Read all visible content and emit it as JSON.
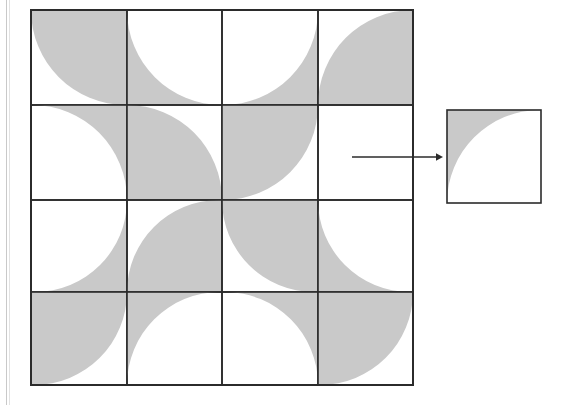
{
  "figure": {
    "title": "Quarter-disc tiling pattern with extracted unit tile",
    "background_color": "#ffffff",
    "fill_color": "#c9c9c9",
    "stroke_color": "#2b2b2b",
    "page_rule_color": "#c9c9c9"
  },
  "grid": {
    "name": "tiling-grid",
    "rows": 4,
    "cols": 4,
    "x": 31,
    "y": 10,
    "col_edges": [
      31,
      127,
      222,
      318,
      413
    ],
    "row_edges": [
      10,
      105,
      200,
      292,
      385
    ],
    "border_width": 1.6,
    "tiles": [
      {
        "row": 1,
        "col": 1,
        "corner": "bottom-left",
        "inverted": true,
        "label": "tile-r1c1"
      },
      {
        "row": 1,
        "col": 2,
        "corner": "bottom-left",
        "inverted": false,
        "label": "tile-r1c2"
      },
      {
        "row": 1,
        "col": 3,
        "corner": "bottom-right",
        "inverted": false,
        "label": "tile-r1c3"
      },
      {
        "row": 1,
        "col": 4,
        "corner": "top-left",
        "inverted": true,
        "label": "tile-r1c4"
      },
      {
        "row": 2,
        "col": 1,
        "corner": "top-right",
        "inverted": false,
        "label": "tile-r2c1"
      },
      {
        "row": 2,
        "col": 2,
        "corner": "top-right",
        "inverted": true,
        "label": "tile-r2c2"
      },
      {
        "row": 2,
        "col": 3,
        "corner": "bottom-right",
        "inverted": true,
        "label": "tile-r2c3"
      },
      {
        "row": 2,
        "col": 4,
        "corner": "none",
        "inverted": false,
        "label": "tile-r2c4"
      },
      {
        "row": 3,
        "col": 1,
        "corner": "bottom-right",
        "inverted": false,
        "label": "tile-r3c1"
      },
      {
        "row": 3,
        "col": 2,
        "corner": "top-left",
        "inverted": true,
        "label": "tile-r3c2"
      },
      {
        "row": 3,
        "col": 3,
        "corner": "bottom-left",
        "inverted": true,
        "label": "tile-r3c3"
      },
      {
        "row": 3,
        "col": 4,
        "corner": "bottom-left",
        "inverted": false,
        "label": "tile-r3c4"
      },
      {
        "row": 4,
        "col": 1,
        "corner": "bottom-right",
        "inverted": true,
        "label": "tile-r4c1"
      },
      {
        "row": 4,
        "col": 2,
        "corner": "top-left",
        "inverted": false,
        "label": "tile-r4c2"
      },
      {
        "row": 4,
        "col": 3,
        "corner": "top-right",
        "inverted": false,
        "label": "tile-r4c3"
      },
      {
        "row": 4,
        "col": 4,
        "corner": "bottom-right",
        "inverted": true,
        "label": "tile-r4c4"
      }
    ]
  },
  "arrow": {
    "name": "points-to-unit-tile",
    "x1": 352,
    "y1": 157,
    "x2": 443,
    "y2": 157,
    "stroke_width": 1.4,
    "head_size": 7
  },
  "unit_tile": {
    "name": "unit-tile",
    "x": 447,
    "y": 110,
    "width": 94,
    "height": 93,
    "corner": "top-left",
    "inverted": false,
    "border_width": 1.6
  }
}
